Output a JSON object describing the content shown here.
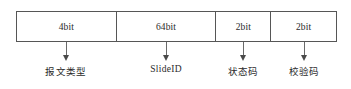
{
  "diagram": {
    "type": "packet-frame-layout",
    "title": "",
    "fields": [
      {
        "size_label": "4bit",
        "caption": "报文类型",
        "cell_class": "cell-w-4bit",
        "center_x": 66
      },
      {
        "size_label": "64bit",
        "caption": "SlideID",
        "cell_class": "cell-w-64bit",
        "center_x": 166
      },
      {
        "size_label": "2bit",
        "caption": "状态码",
        "cell_class": "cell-w-2bit-a",
        "center_x": 243
      },
      {
        "size_label": "2bit",
        "caption": "校验码",
        "cell_class": "cell-w-2bit-b",
        "center_x": 304
      }
    ],
    "colors": {
      "border": "#565656",
      "leader_line": "#6a6a6a",
      "arrowhead": "#4a4a4a",
      "text": "#2a2a2a",
      "background": "#ffffff"
    }
  }
}
